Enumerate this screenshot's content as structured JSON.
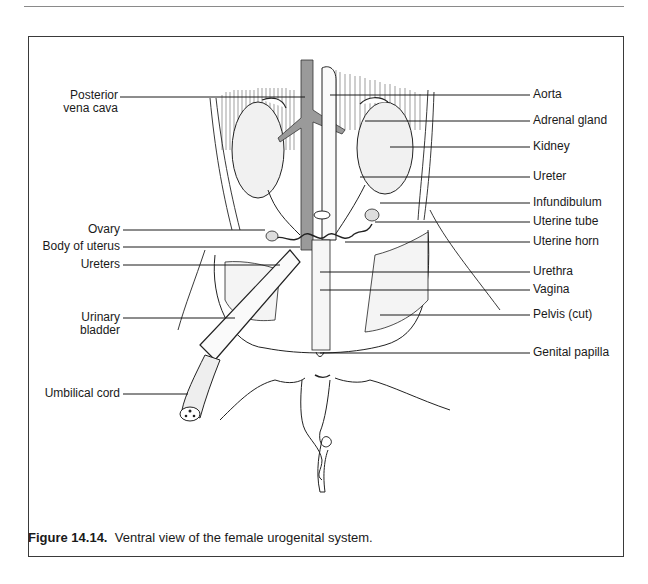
{
  "figure": {
    "number": "Figure 14.14.",
    "caption": "Ventral view of the female urogenital system.",
    "labels_left": [
      {
        "id": "posterior-vena-cava",
        "line1": "Posterior",
        "line2": "vena cava"
      },
      {
        "id": "ovary",
        "text": "Ovary"
      },
      {
        "id": "body-of-uterus",
        "text": "Body of uterus"
      },
      {
        "id": "ureters",
        "text": "Ureters"
      },
      {
        "id": "urinary-bladder",
        "line1": "Urinary",
        "line2": "bladder"
      },
      {
        "id": "umbilical-cord",
        "text": "Umbilical cord"
      }
    ],
    "labels_right": [
      {
        "id": "aorta",
        "text": "Aorta"
      },
      {
        "id": "adrenal-gland",
        "text": "Adrenal gland"
      },
      {
        "id": "kidney",
        "text": "Kidney"
      },
      {
        "id": "ureter",
        "text": "Ureter"
      },
      {
        "id": "infundibulum",
        "text": "Infundibulum"
      },
      {
        "id": "uterine-tube",
        "text": "Uterine tube"
      },
      {
        "id": "uterine-horn",
        "text": "Uterine horn"
      },
      {
        "id": "urethra",
        "text": "Urethra"
      },
      {
        "id": "vagina",
        "text": "Vagina"
      },
      {
        "id": "pelvis-cut",
        "text": "Pelvis (cut)"
      },
      {
        "id": "genital-papilla",
        "text": "Genital papilla"
      }
    ]
  },
  "colors": {
    "ink": "#1a1a1a",
    "vena_cava_fill": "#9a9a9a",
    "border": "#3a3a3a"
  }
}
